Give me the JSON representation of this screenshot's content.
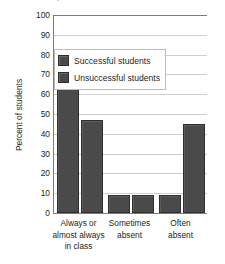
{
  "title_clipped": "Relationship between attendance and success",
  "chart_data": {
    "type": "bar",
    "title": "",
    "xlabel": "",
    "ylabel": "Percent of students",
    "ylim": [
      0,
      100
    ],
    "ytick_step": 10,
    "yticks": [
      "100",
      "90",
      "80",
      "70",
      "60",
      "50",
      "40",
      "30",
      "20",
      "10",
      "0"
    ],
    "grid": true,
    "legend_position": "upper-right-inside",
    "categories": [
      "Always or almost always in class",
      "Sometimes absent",
      "Often absent"
    ],
    "category_lines": [
      [
        "Always or",
        "almost always",
        "in class"
      ],
      [
        "Sometimes",
        "absent"
      ],
      [
        "Often",
        "absent"
      ]
    ],
    "series": [
      {
        "name": "Successful students",
        "values": [
          83,
          9,
          9
        ]
      },
      {
        "name": "Unsuccessful students",
        "values": [
          47,
          9,
          45
        ]
      }
    ],
    "colors": {
      "bar": "#4a4a4a",
      "bar_border": "#2e2e2e",
      "gridline": "#d0cfcd",
      "axis": "#7d7d7d",
      "background": "#ffffff",
      "text": "#231f20"
    }
  }
}
